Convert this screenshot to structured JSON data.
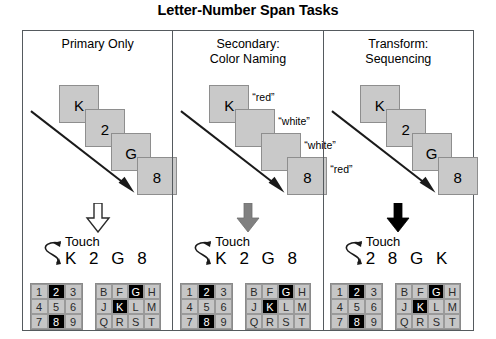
{
  "figure": {
    "title": "Letter-Number Span Tasks"
  },
  "panels": [
    {
      "title": "Primary Only",
      "cards": [
        {
          "label": "K",
          "color_label": ""
        },
        {
          "label": "2",
          "color_label": ""
        },
        {
          "label": "G",
          "color_label": ""
        },
        {
          "label": "8",
          "color_label": ""
        }
      ],
      "arrow_style": "outline",
      "arrow_color": "#ffffff",
      "touch_label": "Touch",
      "touch_sequence": "K 2 G 8",
      "swipe_icon": "swipe-curve-icon",
      "number_pad": {
        "keys": [
          "1",
          "2",
          "3",
          "4",
          "5",
          "6",
          "7",
          "8",
          "9"
        ],
        "highlighted": [
          "2",
          "8"
        ]
      },
      "letter_pad": {
        "keys": [
          "B",
          "F",
          "G",
          "H",
          "J",
          "K",
          "L",
          "M",
          "Q",
          "R",
          "S",
          "T"
        ],
        "highlighted": [
          "G",
          "K"
        ]
      }
    },
    {
      "title": "Secondary:\nColor Naming",
      "cards": [
        {
          "label": "K",
          "color_label": "“red”"
        },
        {
          "label": "",
          "color_label": "“white”"
        },
        {
          "label": "",
          "color_label": "“white”"
        },
        {
          "label": "8",
          "color_label": "“red”"
        }
      ],
      "arrow_style": "gray",
      "arrow_color": "#808080",
      "touch_label": "Touch",
      "touch_sequence": "K 2 G 8",
      "swipe_icon": "swipe-curve-icon",
      "number_pad": {
        "keys": [
          "1",
          "2",
          "3",
          "4",
          "5",
          "6",
          "7",
          "8",
          "9"
        ],
        "highlighted": [
          "2",
          "8"
        ]
      },
      "letter_pad": {
        "keys": [
          "B",
          "F",
          "G",
          "H",
          "J",
          "K",
          "L",
          "M",
          "Q",
          "R",
          "S",
          "T"
        ],
        "highlighted": [
          "G",
          "K"
        ]
      }
    },
    {
      "title": "Transform:\nSequencing",
      "cards": [
        {
          "label": "K",
          "color_label": ""
        },
        {
          "label": "2",
          "color_label": ""
        },
        {
          "label": "G",
          "color_label": ""
        },
        {
          "label": "8",
          "color_label": ""
        }
      ],
      "arrow_style": "black",
      "arrow_color": "#000000",
      "touch_label": "Touch",
      "touch_sequence": "2 8 G K",
      "swipe_icon": "swipe-curve-icon",
      "number_pad": {
        "keys": [
          "1",
          "2",
          "3",
          "4",
          "5",
          "6",
          "7",
          "8",
          "9"
        ],
        "highlighted": [
          "2",
          "8"
        ]
      },
      "letter_pad": {
        "keys": [
          "B",
          "F",
          "G",
          "H",
          "J",
          "K",
          "L",
          "M",
          "Q",
          "R",
          "S",
          "T"
        ],
        "highlighted": [
          "G",
          "K"
        ]
      }
    }
  ],
  "colors": {
    "card_fill": "#c9c9c9",
    "card_border": "#8e8e8e",
    "key_fill": "#c6c6c6",
    "key_highlight": "#000000",
    "panel_border": "#555a5e"
  }
}
